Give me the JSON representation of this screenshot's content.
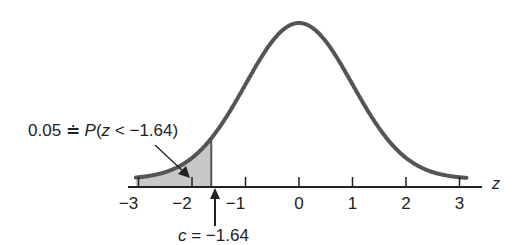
{
  "chart_data": {
    "type": "area",
    "xlabel": "z",
    "x_ticks": [
      -3,
      -2,
      -1,
      0,
      1,
      2,
      3
    ],
    "xlim": [
      -3.4,
      3.5
    ],
    "distribution": "standard normal",
    "shaded_region": {
      "from": -3.3,
      "to": -1.64,
      "probability": 0.05
    },
    "critical_value": -1.64
  },
  "labels": {
    "tail_annotation": "0.05 ≐ P(z < −1.64)",
    "tail_prob": "0.05",
    "approx_sym": "≐",
    "P": "P",
    "open": "(",
    "z": "z",
    "lt": " < −1.64)",
    "critical_c": "c",
    "critical_eq": " = −1.64",
    "axis_var": "z",
    "ticks": [
      "−3",
      "−2",
      "−1",
      "0",
      "1",
      "2",
      "3"
    ]
  },
  "colors": {
    "curve": "#555555",
    "shade": "#c8c8c8",
    "axis": "#222222"
  }
}
